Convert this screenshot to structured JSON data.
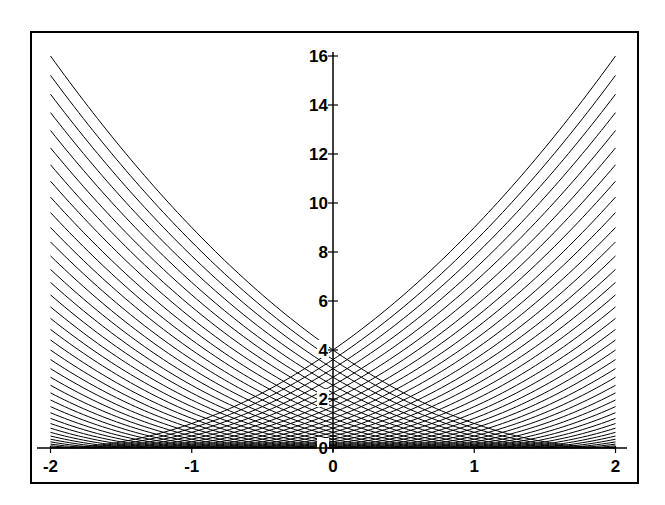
{
  "chart_data": {
    "type": "line",
    "title": "",
    "xlabel": "",
    "ylabel": "",
    "family": {
      "formula": "y = (x - c)^2",
      "c_start": -2,
      "c_end": 2,
      "c_step": 0.1,
      "curve_count": 41
    },
    "xlim": [
      -2,
      2
    ],
    "ylim": [
      0,
      16
    ],
    "x_ticks": [
      -2,
      -1,
      0,
      1,
      2
    ],
    "x_tick_labels": [
      "-2",
      "-1",
      "0",
      "1",
      "2"
    ],
    "y_ticks": [
      0,
      2,
      4,
      6,
      8,
      10,
      12,
      14,
      16
    ],
    "y_tick_labels": [
      "0",
      "2",
      "4",
      "6",
      "8",
      "10",
      "12",
      "14",
      "16"
    ],
    "grid": false,
    "legend": null,
    "axes_through_origin": true,
    "line_color": "#000000",
    "sample_values_at_x_minus_2": [
      16.0,
      15.21,
      14.44,
      13.69,
      12.96,
      12.25,
      11.56,
      10.89,
      10.24,
      9.61,
      9.0,
      8.41,
      7.84,
      7.29,
      6.76,
      6.25,
      5.76,
      5.29,
      4.84,
      4.41,
      4.0,
      3.61,
      3.24,
      2.89,
      2.56,
      2.25,
      1.96,
      1.69,
      1.44,
      1.21,
      1.0,
      0.81,
      0.64,
      0.49,
      0.36,
      0.25,
      0.16,
      0.09,
      0.04,
      0.01,
      0.0
    ]
  },
  "frame": {
    "border_color": "#000000",
    "background": "#ffffff"
  }
}
